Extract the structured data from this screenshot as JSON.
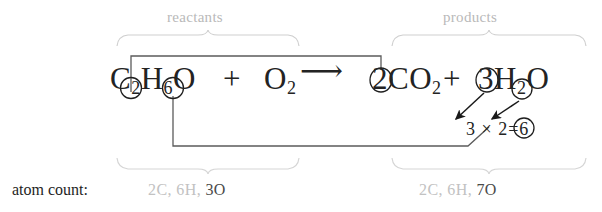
{
  "figure": {
    "kind": "chemical-equation-annotation",
    "group_labels": {
      "reactants": "reactants",
      "products": "products"
    },
    "equation": {
      "reactant_1": {
        "c": "C",
        "c_sub": "2",
        "h": "H",
        "h_sub": "6",
        "o": "O"
      },
      "plus_1": "+",
      "reactant_2": {
        "o": "O",
        "o_sub": "2"
      },
      "arrow": "⟶",
      "product_1": {
        "coef": "2",
        "formula": "CO",
        "sub": "2"
      },
      "plus_2": "+",
      "product_2": {
        "coef": "3",
        "formula": "H",
        "sub": "2",
        "tail": "O"
      }
    },
    "math": {
      "a": "3",
      "times": "×",
      "b": "2",
      "equals": "=",
      "result": "6"
    },
    "atom_count": {
      "label": "atom count:",
      "reactants": {
        "c": "2C,",
        "h": "6H,",
        "o": "3O"
      },
      "products": {
        "c": "2C,",
        "h": "6H,",
        "o": "7O"
      }
    },
    "colors": {
      "ink": "#232323",
      "gray_label": "#b9b9b9",
      "gray_value": "#c2c2c2",
      "dark_value": "#4a4a4a",
      "connector": "#555555",
      "background": "#ffffff"
    }
  }
}
